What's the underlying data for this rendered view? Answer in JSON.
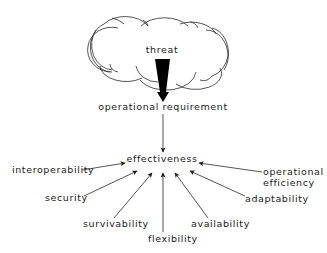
{
  "diagram": {
    "type": "influence-flow",
    "colors": {
      "line": "#2a2a2a",
      "text": "#1a1a1a",
      "arrow_fill": "#000000",
      "background": "#ffffff"
    },
    "source": {
      "label": "threat",
      "shape": "cloud"
    },
    "requirement": {
      "label": "operational requirement"
    },
    "target": {
      "label": "effectiveness"
    },
    "factors": [
      {
        "id": "interoperability",
        "label": "interoperability"
      },
      {
        "id": "security",
        "label": "security"
      },
      {
        "id": "survivability",
        "label": "survivability"
      },
      {
        "id": "flexibility",
        "label": "flexibility"
      },
      {
        "id": "availability",
        "label": "availability"
      },
      {
        "id": "adaptability",
        "label": "adaptability"
      },
      {
        "id": "operational-efficiency",
        "label_line1": "operational",
        "label_line2": "efficiency"
      }
    ],
    "edges": [
      {
        "from": "threat",
        "to": "operational requirement",
        "style": "bold-wedge-arrow"
      },
      {
        "from": "operational requirement",
        "to": "effectiveness",
        "style": "thin-arrow"
      },
      {
        "from": "interoperability",
        "to": "effectiveness",
        "style": "thin-arrow"
      },
      {
        "from": "security",
        "to": "effectiveness",
        "style": "thin-arrow"
      },
      {
        "from": "survivability",
        "to": "effectiveness",
        "style": "thin-arrow"
      },
      {
        "from": "flexibility",
        "to": "effectiveness",
        "style": "thin-arrow"
      },
      {
        "from": "availability",
        "to": "effectiveness",
        "style": "thin-arrow"
      },
      {
        "from": "adaptability",
        "to": "effectiveness",
        "style": "thin-arrow"
      },
      {
        "from": "operational efficiency",
        "to": "effectiveness",
        "style": "thin-arrow"
      }
    ]
  }
}
